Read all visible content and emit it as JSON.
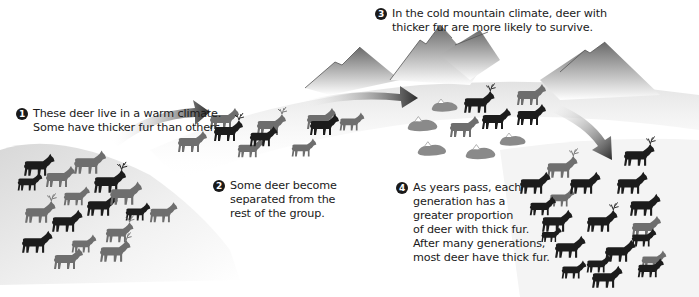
{
  "diagram": {
    "topic": "Natural selection of fur thickness in deer",
    "colors": {
      "thick_fur_deer": "#1c1c1c",
      "thin_fur_deer": "#6e6e6e",
      "fallen_deer": "#8a8a8a",
      "arrow_dark": "#2b2b2b",
      "ground_shade": "#cfcfcf",
      "mountain": "#777777",
      "snow": "#ffffff"
    },
    "steps": [
      {
        "number": "1",
        "lines": [
          "These deer live in a warm climate.",
          "Some have thicker fur than others."
        ]
      },
      {
        "number": "2",
        "lines": [
          "Some deer become",
          "separated from the",
          "rest of the group."
        ]
      },
      {
        "number": "3",
        "lines": [
          "In the cold mountain climate, deer with",
          "thicker fur are more likely to survive."
        ]
      },
      {
        "number": "4",
        "lines": [
          "As years pass, each",
          "generation has a",
          "greater proportion",
          "of deer with thick fur.",
          "After many generations,",
          "most deer have thick fur."
        ]
      }
    ],
    "groups": [
      {
        "name": "warm-climate-herd",
        "thick_fur_count": 9,
        "thin_fur_count": 11
      },
      {
        "name": "separated-group",
        "thick_fur_count": 3,
        "thin_fur_count": 7
      },
      {
        "name": "mountain-survivors",
        "thick_fur_count": 4,
        "thin_fur_count": 2,
        "fallen_count": 6
      },
      {
        "name": "later-generations",
        "thick_fur_count": 16,
        "thin_fur_count": 4
      }
    ]
  }
}
